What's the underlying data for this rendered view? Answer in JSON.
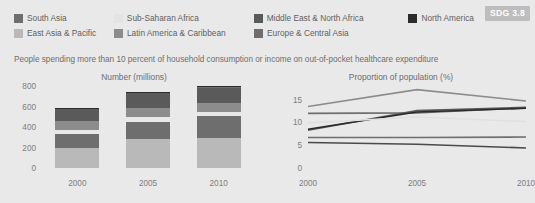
{
  "badge": {
    "label": "SDG 3.8"
  },
  "subtitle": "People spending more than 10 percent of household consumption or income on out-of-pocket healthcare expenditure",
  "legend": {
    "rows": [
      [
        {
          "label": "South Asia",
          "color": "#6e6e6e"
        },
        {
          "label": "Sub-Saharan Africa",
          "color": "#e3e3e3"
        },
        {
          "label": "Middle East & North Africa",
          "color": "#5a5a5a"
        },
        {
          "label": "North America",
          "color": "#2b2b2b"
        }
      ],
      [
        {
          "label": "East Asia & Pacific",
          "color": "#b9b9b9"
        },
        {
          "label": "Latin America & Caribbean",
          "color": "#8c8c8c"
        },
        {
          "label": "Europe & Central Asia",
          "color": "#6e6e6e"
        }
      ]
    ]
  },
  "chart_data": [
    {
      "type": "bar",
      "title": "Number (millions)",
      "xlabel": "",
      "ylabel": "",
      "categories": [
        "2000",
        "2005",
        "2010"
      ],
      "yticks": [
        0,
        200,
        400,
        600,
        800
      ],
      "ylim": [
        0,
        800
      ],
      "grid": false,
      "stacked": true,
      "legend_position": "top",
      "series": [
        {
          "name": "East Asia & Pacific",
          "color": "#b9b9b9",
          "values": [
            200,
            280,
            292
          ]
        },
        {
          "name": "South Asia",
          "color": "#6e6e6e",
          "values": [
            130,
            172,
            212
          ]
        },
        {
          "name": "Sub-Saharan Africa",
          "color": "#e8e8e8",
          "values": [
            42,
            44,
            44
          ]
        },
        {
          "name": "Latin America & Caribbean",
          "color": "#8c8c8c",
          "values": [
            88,
            90,
            86
          ]
        },
        {
          "name": "Middle East & North Africa",
          "color": "#5a5a5a",
          "values": [
            118,
            142,
            150
          ]
        },
        {
          "name": "Europe & Central Asia",
          "color": "#6e6e6e",
          "values": [
            8,
            9,
            10
          ]
        },
        {
          "name": "North America",
          "color": "#2b2b2b",
          "values": [
            4,
            5,
            6
          ]
        }
      ],
      "totals": [
        590,
        742,
        800
      ]
    },
    {
      "type": "line",
      "title": "Proportion of population (%)",
      "xlabel": "",
      "ylabel": "",
      "x": [
        "2000",
        "2005",
        "2010"
      ],
      "yticks": [
        0,
        5,
        10,
        15
      ],
      "ylim": [
        0,
        18
      ],
      "grid": false,
      "legend_position": "top",
      "series": [
        {
          "name": "Latin America & Caribbean",
          "color": "#8c8c8c",
          "values": [
            13.5,
            17.2,
            14.7
          ]
        },
        {
          "name": "South Asia",
          "color": "#6e6e6e",
          "values": [
            12.0,
            12.1,
            13.2
          ]
        },
        {
          "name": "Middle East & North Africa",
          "color": "#5a5a5a",
          "values": [
            8.3,
            12.6,
            13.3
          ]
        },
        {
          "name": "North America",
          "color": "#2b2b2b",
          "values": [
            8.5,
            12.3,
            13.1
          ]
        },
        {
          "name": "Sub-Saharan Africa",
          "color": "#e0e0e0",
          "values": [
            9.9,
            11.2,
            10.2
          ]
        },
        {
          "name": "Europe & Central Asia",
          "color": "#6e6e6e",
          "values": [
            6.7,
            6.7,
            6.8
          ]
        },
        {
          "name": "East Asia & Pacific",
          "color": "#4a4a4a",
          "values": [
            5.6,
            5.2,
            4.4
          ]
        }
      ]
    }
  ]
}
